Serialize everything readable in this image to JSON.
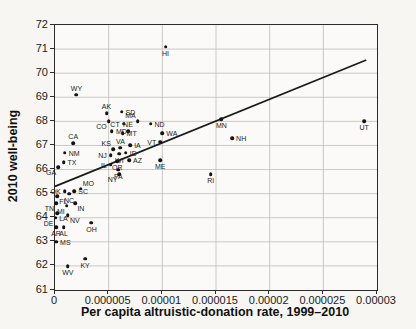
{
  "chart_data": {
    "type": "scatter",
    "title": "",
    "xlabel": "Per capita altruistic-donation rate, 1999–2010",
    "ylabel": "2010 well-being",
    "xlim": [
      0,
      3e-05
    ],
    "ylim": [
      61,
      72
    ],
    "grid": true,
    "legend": "none",
    "xticks": [
      {
        "value": 0,
        "label": "0"
      },
      {
        "value": 5e-06,
        "label": "0.000005"
      },
      {
        "value": 1e-05,
        "label": "0.00001"
      },
      {
        "value": 1.5e-05,
        "label": "0.000015"
      },
      {
        "value": 2e-05,
        "label": "0.00002"
      },
      {
        "value": 2.5e-05,
        "label": "0.000025"
      },
      {
        "value": 3e-05,
        "label": "0.00003"
      }
    ],
    "yticks": [
      {
        "value": 72,
        "label": "72"
      },
      {
        "value": 71,
        "label": "71"
      },
      {
        "value": 70,
        "label": "70"
      },
      {
        "value": 69,
        "label": "69"
      },
      {
        "value": 68,
        "label": "68"
      },
      {
        "value": 67,
        "label": "67"
      },
      {
        "value": 66,
        "label": "66"
      },
      {
        "value": 65,
        "label": "65"
      },
      {
        "value": 64,
        "label": "64"
      },
      {
        "value": 63,
        "label": "63"
      },
      {
        "value": 62,
        "label": "62"
      },
      {
        "value": 61,
        "label": "61"
      }
    ],
    "trendline": {
      "x1": 0,
      "y1": 65.3,
      "x2": 2.9e-05,
      "y2": 70.55
    },
    "points": [
      {
        "state": "HI",
        "x": 1.03e-05,
        "y": 71.1,
        "label_pos": "below"
      },
      {
        "state": "WY",
        "x": 2e-06,
        "y": 69.1,
        "label_pos": "above"
      },
      {
        "state": "SD",
        "x": 6.2e-06,
        "y": 68.4,
        "label_pos": "right"
      },
      {
        "state": "AK",
        "x": 4.8e-06,
        "y": 68.35,
        "label_pos": "above"
      },
      {
        "state": "MN",
        "x": 1.55e-05,
        "y": 68.1,
        "label_pos": "below"
      },
      {
        "state": "UT",
        "x": 2.88e-05,
        "y": 68.0,
        "label_pos": "below"
      },
      {
        "state": "MA",
        "x": 7.7e-06,
        "y": 68.0,
        "label_pos": "above-left"
      },
      {
        "state": "CO",
        "x": 5e-06,
        "y": 68.0,
        "label_pos": "below-left"
      },
      {
        "state": "CT",
        "x": 6.4e-06,
        "y": 67.9,
        "label_pos": "left"
      },
      {
        "state": "ND",
        "x": 8.9e-06,
        "y": 67.9,
        "label_pos": "right"
      },
      {
        "state": "MD",
        "x": 5.3e-06,
        "y": 67.6,
        "label_pos": "right"
      },
      {
        "state": "NE",
        "x": 6.8e-06,
        "y": 67.6,
        "label_pos": "above"
      },
      {
        "state": "WA",
        "x": 1e-05,
        "y": 67.5,
        "label_pos": "right"
      },
      {
        "state": "MT",
        "x": 6.3e-06,
        "y": 67.5,
        "label_pos": "right"
      },
      {
        "state": "NH",
        "x": 1.65e-05,
        "y": 67.3,
        "label_pos": "right"
      },
      {
        "state": "VT",
        "x": 9.8e-06,
        "y": 67.15,
        "label_pos": "left"
      },
      {
        "state": "CA",
        "x": 1.7e-06,
        "y": 67.1,
        "label_pos": "above"
      },
      {
        "state": "IA",
        "x": 7e-06,
        "y": 67.0,
        "label_pos": "right"
      },
      {
        "state": "VA",
        "x": 6.1e-06,
        "y": 66.9,
        "label_pos": "above"
      },
      {
        "state": "KS",
        "x": 5.4e-06,
        "y": 66.85,
        "label_pos": "above-left"
      },
      {
        "state": "NM",
        "x": 9e-07,
        "y": 66.7,
        "label_pos": "right"
      },
      {
        "state": "ID",
        "x": 6.6e-06,
        "y": 66.7,
        "label_pos": "right"
      },
      {
        "state": "WI",
        "x": 6e-06,
        "y": 66.65,
        "label_pos": "below"
      },
      {
        "state": "NJ",
        "x": 5.2e-06,
        "y": 66.6,
        "label_pos": "left"
      },
      {
        "state": "ME",
        "x": 9.8e-06,
        "y": 66.4,
        "label_pos": "below"
      },
      {
        "state": "AZ",
        "x": 6.9e-06,
        "y": 66.4,
        "label_pos": "right"
      },
      {
        "state": "OR",
        "x": 5.8e-06,
        "y": 66.35,
        "label_pos": "below"
      },
      {
        "state": "TX",
        "x": 8e-07,
        "y": 66.3,
        "label_pos": "right"
      },
      {
        "state": "IL",
        "x": 5.2e-06,
        "y": 66.2,
        "label_pos": "left"
      },
      {
        "state": "GA",
        "x": 3e-07,
        "y": 66.1,
        "label_pos": "below-left"
      },
      {
        "state": "PA",
        "x": 5.9e-06,
        "y": 66.0,
        "label_pos": "below"
      },
      {
        "state": "NY",
        "x": 6e-06,
        "y": 65.8,
        "label_pos": "below-left"
      },
      {
        "state": "RI",
        "x": 1.45e-05,
        "y": 65.8,
        "label_pos": "below"
      },
      {
        "state": "MO",
        "x": 2.4e-06,
        "y": 65.2,
        "label_pos": "above-right"
      },
      {
        "state": "SC",
        "x": 1.8e-06,
        "y": 65.1,
        "label_pos": "right"
      },
      {
        "state": "OK",
        "x": 9e-07,
        "y": 65.1,
        "label_pos": "left"
      },
      {
        "state": "NC",
        "x": 1.3e-06,
        "y": 65.0,
        "label_pos": "below"
      },
      {
        "state": "FL",
        "x": 2e-07,
        "y": 64.9,
        "label_pos": "below-right"
      },
      {
        "state": "TN",
        "x": 1e-07,
        "y": 64.6,
        "label_pos": "below-left"
      },
      {
        "state": "IN",
        "x": 1.9e-06,
        "y": 64.6,
        "label_pos": "below-right"
      },
      {
        "state": "MI",
        "x": 1.1e-06,
        "y": 64.5,
        "label_pos": "below-left"
      },
      {
        "state": "LA",
        "x": 2e-07,
        "y": 64.2,
        "label_pos": "below-right"
      },
      {
        "state": "NV",
        "x": 1.2e-06,
        "y": 64.1,
        "label_pos": "below-right"
      },
      {
        "state": "DE",
        "x": 5e-08,
        "y": 64.0,
        "label_pos": "below-left"
      },
      {
        "state": "OH",
        "x": 3.4e-06,
        "y": 63.8,
        "label_pos": "below"
      },
      {
        "state": "AR",
        "x": 1e-07,
        "y": 63.6,
        "label_pos": "below"
      },
      {
        "state": "AL",
        "x": 8e-07,
        "y": 63.6,
        "label_pos": "below"
      },
      {
        "state": "MS",
        "x": 1e-07,
        "y": 63.0,
        "label_pos": "right"
      },
      {
        "state": "KY",
        "x": 2.8e-06,
        "y": 62.3,
        "label_pos": "below"
      },
      {
        "state": "WV",
        "x": 1.2e-06,
        "y": 62.0,
        "label_pos": "below"
      }
    ],
    "colors": {
      "dot": "#141414",
      "grid": "#bcbcb8",
      "axis": "#2b2b2b",
      "trend": "#1a1a1a",
      "background": "#f7f6f3"
    }
  }
}
